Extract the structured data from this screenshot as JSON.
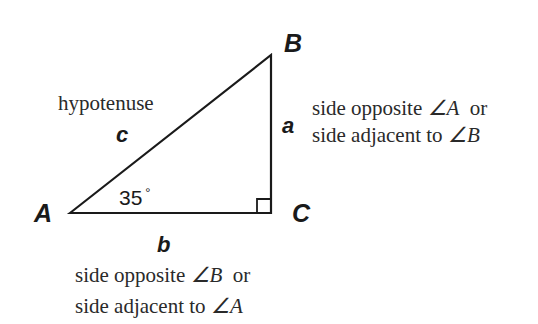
{
  "diagram": {
    "type": "right-triangle",
    "vertices": {
      "A": {
        "label": "A",
        "x": 70,
        "y": 213
      },
      "B": {
        "label": "B",
        "x": 271,
        "y": 55
      },
      "C": {
        "label": "C",
        "x": 271,
        "y": 213
      }
    },
    "angle_A": {
      "value": "35",
      "unit": "°"
    },
    "right_angle_at": "C",
    "sides": {
      "c": {
        "label": "c",
        "name": "hypotenuse"
      },
      "a": {
        "label": "a",
        "desc_line1_prefix": "side opposite ",
        "desc_line1_angle": "∠A",
        "desc_line1_suffix": "  or",
        "desc_line2_prefix": "side adjacent to ",
        "desc_line2_angle": "∠B"
      },
      "b": {
        "label": "b",
        "desc_line1_prefix": "side opposite ",
        "desc_line1_angle": "∠B",
        "desc_line1_suffix": "  or",
        "desc_line2_prefix": "side adjacent to ",
        "desc_line2_angle": "∠A"
      }
    },
    "colors": {
      "stroke": "#1a1a1a",
      "background": "#ffffff"
    }
  }
}
